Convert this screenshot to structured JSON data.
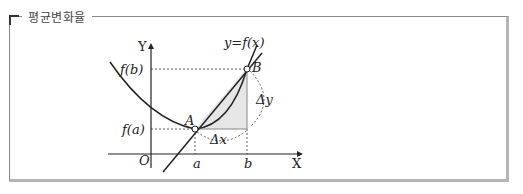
{
  "panel": {
    "title": "평균변화율"
  },
  "diagram": {
    "axis_x_label": "X",
    "axis_y_label": "Y",
    "origin_label": "O",
    "curve_label": "y=f(x)",
    "point_a_label": "A",
    "point_b_label": "B",
    "tick_a": "a",
    "tick_b": "b",
    "y_tick_fa": "f(a)",
    "y_tick_fb": "f(b)",
    "delta_x": "Δx",
    "delta_y": "Δy",
    "colors": {
      "stroke": "#222222",
      "shade": "#e6e6e6",
      "border": "#b5b5b5"
    }
  }
}
